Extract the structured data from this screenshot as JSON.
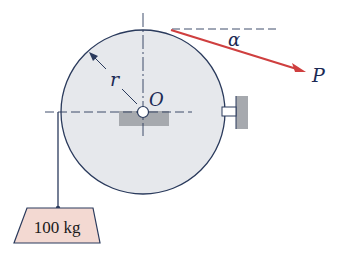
{
  "diagram": {
    "type": "mechanics-free-body",
    "labels": {
      "radius": "r",
      "center": "O",
      "angle": "α",
      "force": "P",
      "mass": "100 kg"
    },
    "colors": {
      "drum_fill": "#e6e8ec",
      "drum_stroke": "#2a3a5c",
      "force_arrow": "#cf3f3f",
      "mass_fill": "#f3d9d2",
      "support_fill": "#a6a9ae",
      "line": "#2a3a5c"
    },
    "geometry": {
      "drum_center": [
        143,
        112
      ],
      "drum_radius": 82
    }
  }
}
